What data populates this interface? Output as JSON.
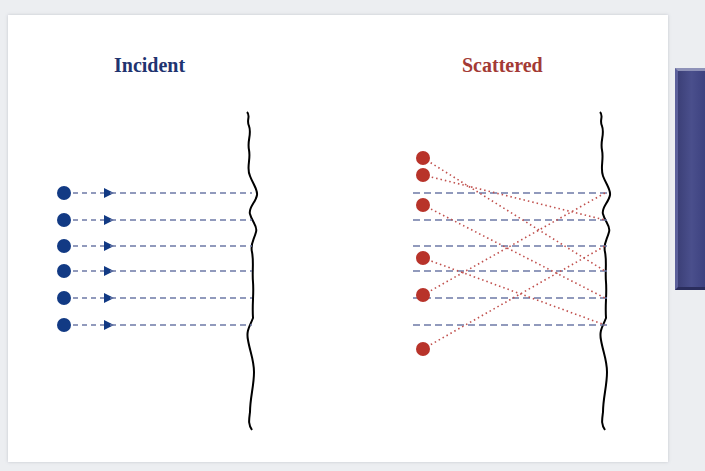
{
  "panels": {
    "incident": {
      "title": "Incident",
      "color": "#1f3470"
    },
    "scattered": {
      "title": "Scattered",
      "color": "#a33a35"
    }
  },
  "colors": {
    "incident_dot": "#123a84",
    "scattered_dot": "#b8332a",
    "dashed_line": "#6e7aa6",
    "scatter_line": "#c0504d",
    "surface": "#000000"
  },
  "incident_rays_y": [
    193,
    220,
    246,
    271,
    298,
    325
  ],
  "scattered_dots_y": [
    158,
    175,
    205,
    258,
    295,
    349
  ],
  "scattered_paths": [
    {
      "from_y": 158,
      "to_y": 271
    },
    {
      "from_y": 175,
      "to_y": 220
    },
    {
      "from_y": 205,
      "to_y": 298
    },
    {
      "from_y": 258,
      "to_y": 325
    },
    {
      "from_y": 295,
      "to_y": 193
    },
    {
      "from_y": 349,
      "to_y": 246
    }
  ]
}
